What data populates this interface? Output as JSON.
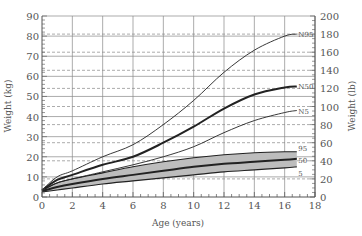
{
  "chart_data": {
    "type": "line",
    "title": "",
    "xlabel": "Age (years)",
    "ylabel": "Weight (kg)",
    "y2label": "Weight (lb)",
    "xlim": [
      0,
      18
    ],
    "ylim": [
      0,
      90
    ],
    "y2lim": [
      0,
      200
    ],
    "x_ticks": [
      0,
      2,
      4,
      6,
      8,
      10,
      12,
      14,
      16,
      18
    ],
    "y_ticks": [
      0,
      10,
      20,
      30,
      40,
      50,
      60,
      70,
      80,
      90
    ],
    "y2_ticks": [
      0,
      20,
      40,
      60,
      80,
      100,
      120,
      140,
      160,
      180,
      200
    ],
    "grid": {
      "solid_kg_lines": true,
      "dashed_lb_lines": true,
      "vertical_every_years": 2
    },
    "legend": "inline labels at right end of curves",
    "x": [
      0,
      1,
      2,
      4,
      6,
      8,
      10,
      12,
      14,
      16,
      16.8
    ],
    "series": [
      {
        "name": "N95",
        "style": "thin",
        "values": [
          3.5,
          10,
          13,
          20,
          26,
          36,
          48,
          62,
          73,
          80,
          81
        ]
      },
      {
        "name": "N50",
        "style": "thick",
        "values": [
          3.3,
          8.5,
          11,
          16,
          20,
          27,
          35,
          44,
          51,
          54.5,
          55
        ]
      },
      {
        "name": "N5",
        "style": "thin",
        "values": [
          3,
          7,
          9,
          12.5,
          16,
          20,
          25,
          32,
          38,
          42,
          43
        ]
      },
      {
        "name": "95",
        "style": "band-top",
        "values": [
          3.5,
          7,
          9,
          12,
          15,
          17.5,
          19.5,
          21,
          22,
          22.5,
          22.5
        ]
      },
      {
        "name": "50",
        "style": "thick",
        "values": [
          3,
          5,
          6.5,
          9,
          11,
          13,
          15,
          16.5,
          17.5,
          18.5,
          19
        ]
      },
      {
        "name": "5",
        "style": "band-bottom",
        "values": [
          2.5,
          3.5,
          4.5,
          6.5,
          8,
          9.5,
          11,
          12.5,
          13.5,
          14.5,
          15
        ]
      }
    ],
    "band": {
      "between": [
        "5",
        "95"
      ],
      "fill": "#b8b8b8"
    }
  },
  "colors": {
    "axis": "#555555",
    "grid": "#888888",
    "line": "#222222",
    "band": "#bdbdbd"
  }
}
